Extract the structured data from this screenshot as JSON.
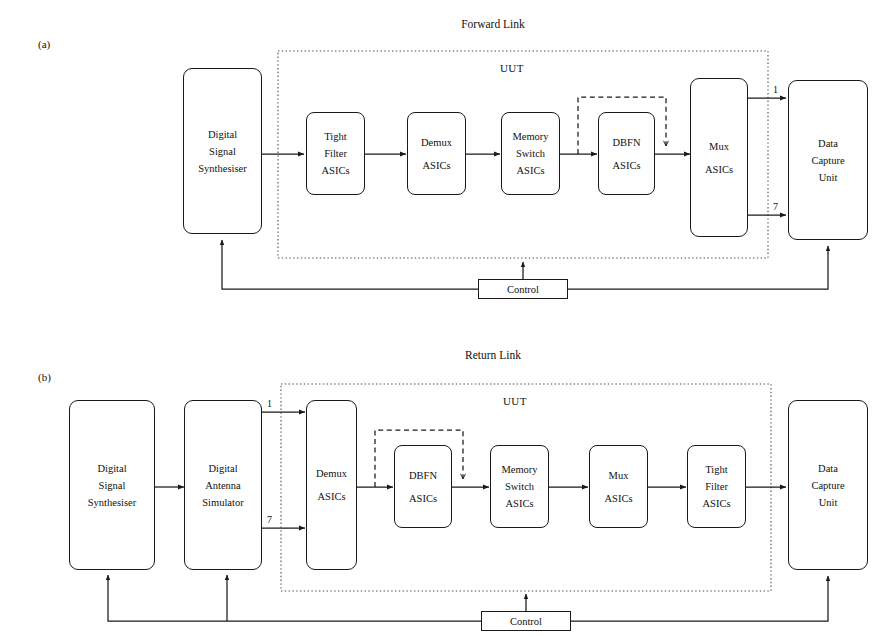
{
  "figure": {
    "background": "#ffffff",
    "stroke": "#1a1a1a"
  },
  "panels": [
    {
      "tag": "(a)",
      "title": "Forward Link",
      "uut_label": "UUT",
      "control_label": "Control",
      "port_labels": [
        "1",
        "7"
      ],
      "nodes": [
        {
          "id": "dss",
          "lines": [
            "Digital",
            "Signal",
            "Synthesiser"
          ]
        },
        {
          "id": "tight",
          "lines": [
            "Tight",
            "Filter",
            "ASICs"
          ]
        },
        {
          "id": "demux",
          "lines": [
            "Demux",
            "ASICs"
          ]
        },
        {
          "id": "memsw",
          "lines": [
            "Memory",
            "Switch",
            "ASICs"
          ]
        },
        {
          "id": "dbfn",
          "lines": [
            "DBFN",
            "ASICs"
          ]
        },
        {
          "id": "mux",
          "lines": [
            "Mux",
            "ASICs"
          ]
        },
        {
          "id": "dcu",
          "lines": [
            "Data",
            "Capture",
            "Unit"
          ]
        }
      ]
    },
    {
      "tag": "(b)",
      "title": "Return Link",
      "uut_label": "UUT",
      "control_label": "Control",
      "port_labels": [
        "1",
        "7"
      ],
      "nodes": [
        {
          "id": "dss",
          "lines": [
            "Digital",
            "Signal",
            "Synthesiser"
          ]
        },
        {
          "id": "das",
          "lines": [
            "Digital",
            "Antenna",
            "Simulator"
          ]
        },
        {
          "id": "demux",
          "lines": [
            "Demux",
            "ASICs"
          ]
        },
        {
          "id": "dbfn",
          "lines": [
            "DBFN",
            "ASICs"
          ]
        },
        {
          "id": "memsw",
          "lines": [
            "Memory",
            "Switch",
            "ASICs"
          ]
        },
        {
          "id": "mux",
          "lines": [
            "Mux",
            "ASICs"
          ]
        },
        {
          "id": "tight",
          "lines": [
            "Tight",
            "Filter",
            "ASICs"
          ]
        },
        {
          "id": "dcu",
          "lines": [
            "Data",
            "Capture",
            "Unit"
          ]
        }
      ]
    }
  ]
}
